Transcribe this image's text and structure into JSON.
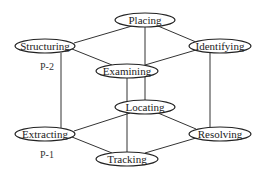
{
  "diagram": {
    "type": "lattice / cube graph",
    "nodes": [
      {
        "id": "placing",
        "label": "Placing",
        "cx": 145,
        "cy": 20,
        "rx": 30,
        "ry": 7
      },
      {
        "id": "structuring",
        "label": "Structuring",
        "cx": 45,
        "cy": 46,
        "rx": 30,
        "ry": 7
      },
      {
        "id": "identifying",
        "label": "Identifying",
        "cx": 220,
        "cy": 46,
        "rx": 31,
        "ry": 7
      },
      {
        "id": "examining",
        "label": "Examining",
        "cx": 127,
        "cy": 71,
        "rx": 31,
        "ry": 7
      },
      {
        "id": "locating",
        "label": "Locating",
        "cx": 145,
        "cy": 107,
        "rx": 30,
        "ry": 7
      },
      {
        "id": "extracting",
        "label": "Extracting",
        "cx": 45,
        "cy": 134,
        "rx": 30,
        "ry": 7
      },
      {
        "id": "resolving",
        "label": "Resolving",
        "cx": 220,
        "cy": 134,
        "rx": 31,
        "ry": 7
      },
      {
        "id": "tracking",
        "label": "Tracking",
        "cx": 127,
        "cy": 159,
        "rx": 31,
        "ry": 7
      }
    ],
    "edges": [
      {
        "from": "placing",
        "to": "structuring",
        "x1": 132,
        "y1": 26,
        "x2": 74,
        "y2": 43
      },
      {
        "from": "placing",
        "to": "identifying",
        "x1": 158,
        "y1": 26,
        "x2": 196,
        "y2": 42
      },
      {
        "from": "structuring",
        "to": "examining",
        "x1": 72,
        "y1": 49,
        "x2": 112,
        "y2": 65
      },
      {
        "from": "identifying",
        "to": "examining",
        "x1": 196,
        "y1": 50,
        "x2": 145,
        "y2": 65
      },
      {
        "from": "placing",
        "to": "locating",
        "x1": 145,
        "y1": 27,
        "x2": 145,
        "y2": 100
      },
      {
        "from": "structuring",
        "to": "extracting",
        "x1": 61,
        "y1": 53,
        "x2": 61,
        "y2": 128
      },
      {
        "from": "identifying",
        "to": "resolving",
        "x1": 210,
        "y1": 53,
        "x2": 210,
        "y2": 127
      },
      {
        "from": "examining",
        "to": "tracking",
        "x1": 127,
        "y1": 78,
        "x2": 127,
        "y2": 152
      },
      {
        "from": "locating",
        "to": "extracting",
        "x1": 130,
        "y1": 113,
        "x2": 74,
        "y2": 131
      },
      {
        "from": "locating",
        "to": "resolving",
        "x1": 158,
        "y1": 113,
        "x2": 196,
        "y2": 129
      },
      {
        "from": "extracting",
        "to": "tracking",
        "x1": 72,
        "y1": 137,
        "x2": 112,
        "y2": 153
      },
      {
        "from": "resolving",
        "to": "tracking",
        "x1": 196,
        "y1": 138,
        "x2": 145,
        "y2": 153
      }
    ],
    "annotations": [
      {
        "id": "p2",
        "label": "P-2",
        "x": 40,
        "y": 70
      },
      {
        "id": "p1",
        "label": "P-1",
        "x": 40,
        "y": 158
      }
    ]
  }
}
